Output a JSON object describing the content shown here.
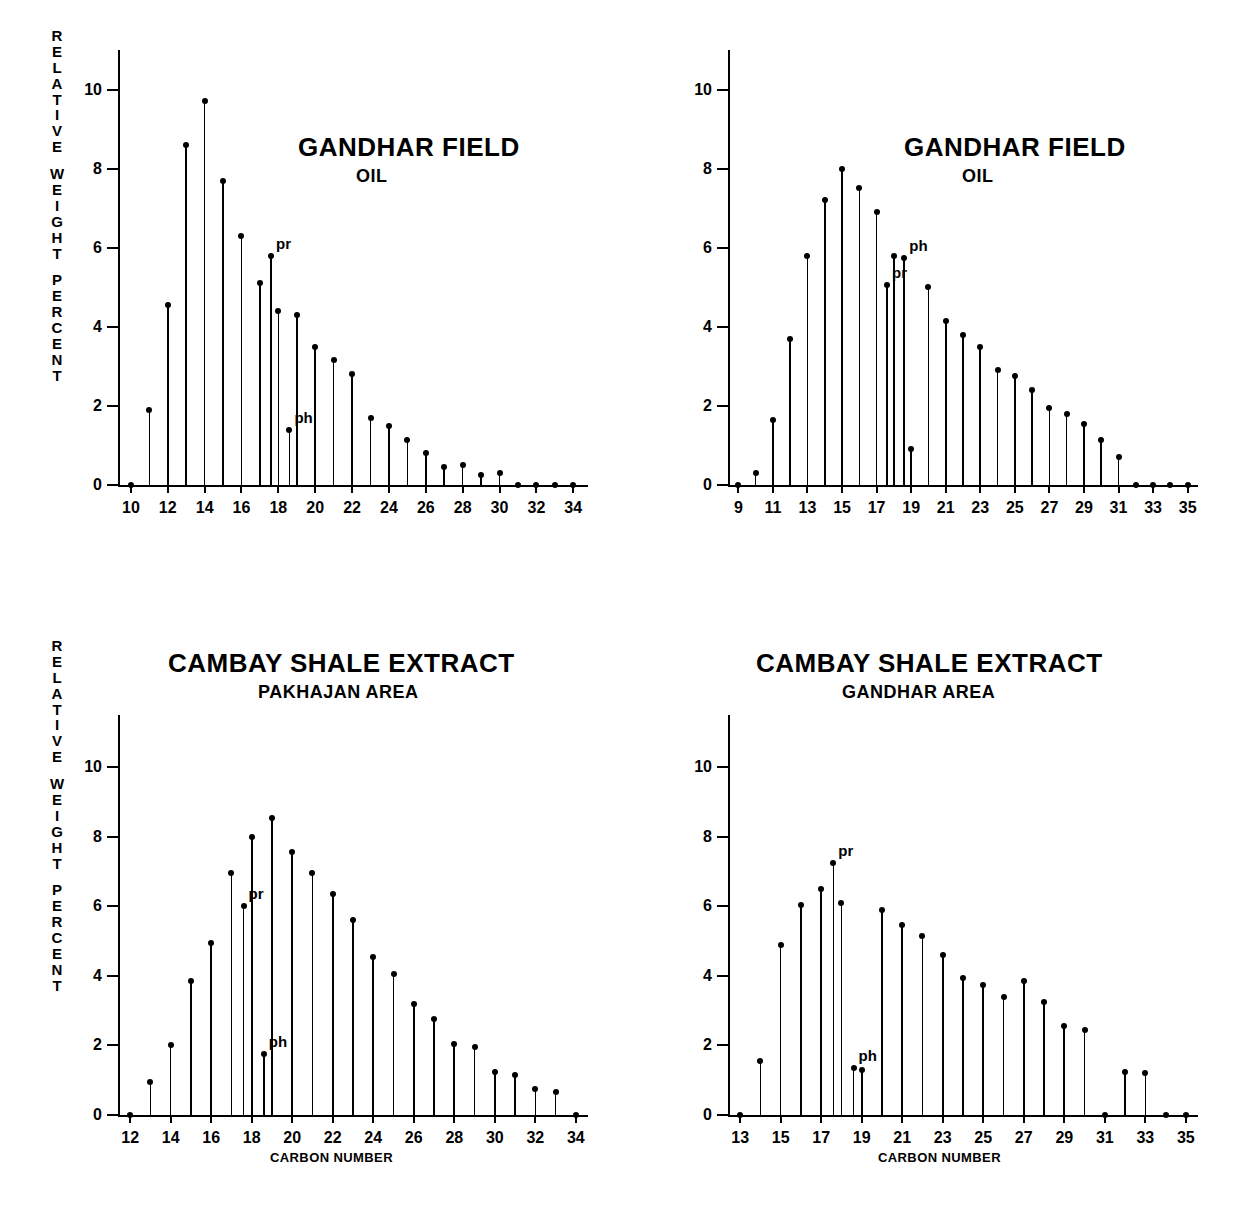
{
  "figure": {
    "y_axis_caption": "RELATIVE WEIGHT PERCENT",
    "y_axis_caption_groups": [
      [
        "R",
        "E",
        "L",
        "A",
        "T",
        "I",
        "V",
        "E"
      ],
      [
        "W",
        "E",
        "I",
        "G",
        "H",
        "T"
      ],
      [
        "P",
        "E",
        "R",
        "C",
        "E",
        "N",
        "T"
      ]
    ],
    "x_axis_caption": "CARBON NUMBER",
    "annotation_pristane": "pr",
    "annotation_phytane": "ph",
    "ink_color": "#000000",
    "background_color": "#ffffff"
  },
  "chart_data": [
    {
      "id": "panel-top-left",
      "type": "bar",
      "title": "GANDHAR FIELD",
      "subtitle": "OIL",
      "xlabel": "",
      "ylabel": "RELATIVE WEIGHT PERCENT",
      "ylim": [
        0,
        11
      ],
      "yticks": [
        0,
        2,
        4,
        6,
        8,
        10
      ],
      "xlim": [
        9.3,
        34.8
      ],
      "xticks": [
        10,
        12,
        14,
        16,
        18,
        20,
        22,
        24,
        26,
        28,
        30,
        32,
        34
      ],
      "grid": false,
      "legend": "none",
      "categories": [
        10,
        11,
        12,
        13,
        14,
        15,
        16,
        17,
        18,
        19,
        20,
        21,
        22,
        23,
        24,
        25,
        26,
        27,
        28,
        29,
        30,
        31,
        32,
        33,
        34
      ],
      "values": [
        0.05,
        1.9,
        4.55,
        8.6,
        9.7,
        7.7,
        6.3,
        5.1,
        4.4,
        4.3,
        3.5,
        3.15,
        2.8,
        1.7,
        1.5,
        1.15,
        0.8,
        0.45,
        0.5,
        0.25,
        0.3,
        0.05,
        0.0,
        0.0,
        0.0
      ],
      "annotations": [
        {
          "label": "pr",
          "carbon": 17.6,
          "value": 5.8
        },
        {
          "label": "ph",
          "carbon": 18.6,
          "value": 1.4
        }
      ],
      "extra_stems": [
        {
          "carbon": 17.6,
          "value": 5.8,
          "label": "pristane"
        },
        {
          "carbon": 18.6,
          "value": 1.4,
          "label": "phytane"
        }
      ]
    },
    {
      "id": "panel-top-right",
      "type": "bar",
      "title": "GANDHAR FIELD",
      "subtitle": "OIL",
      "xlabel": "",
      "ylabel": "",
      "ylim": [
        0,
        11
      ],
      "yticks": [
        0,
        2,
        4,
        6,
        8,
        10
      ],
      "xlim": [
        8.4,
        35.6
      ],
      "xticks": [
        9,
        11,
        13,
        15,
        17,
        19,
        21,
        23,
        25,
        27,
        29,
        31,
        33,
        35
      ],
      "grid": false,
      "legend": "none",
      "categories": [
        9,
        10,
        11,
        12,
        13,
        14,
        15,
        16,
        17,
        18,
        19,
        20,
        21,
        22,
        23,
        24,
        25,
        26,
        27,
        28,
        29,
        30,
        31,
        32,
        33,
        34,
        35
      ],
      "values": [
        0.1,
        0.3,
        1.65,
        3.7,
        5.8,
        7.2,
        8.0,
        7.5,
        6.9,
        5.8,
        0.9,
        5.0,
        4.15,
        3.8,
        3.5,
        2.9,
        2.75,
        2.4,
        1.95,
        1.8,
        1.55,
        1.15,
        0.7,
        0.05,
        0.0,
        0.0,
        0.0
      ],
      "annotations": [
        {
          "label": "pr",
          "carbon": 17.6,
          "value": 5.05
        },
        {
          "label": "ph",
          "carbon": 18.6,
          "value": 5.75
        }
      ],
      "extra_stems": [
        {
          "carbon": 17.6,
          "value": 5.05,
          "label": "pristane"
        },
        {
          "carbon": 18.6,
          "value": 5.75,
          "label": "phytane-coelute"
        }
      ]
    },
    {
      "id": "panel-bottom-left",
      "type": "bar",
      "title": "CAMBAY SHALE EXTRACT",
      "subtitle": "PAKHAJAN AREA",
      "xlabel": "CARBON NUMBER",
      "ylabel": "RELATIVE WEIGHT PERCENT",
      "ylim": [
        0,
        11.5
      ],
      "yticks": [
        0,
        2,
        4,
        6,
        8,
        10
      ],
      "xlim": [
        11.4,
        34.6
      ],
      "xticks": [
        12,
        14,
        16,
        18,
        20,
        22,
        24,
        26,
        28,
        30,
        32,
        34
      ],
      "grid": false,
      "legend": "none",
      "categories": [
        12,
        13,
        14,
        15,
        16,
        17,
        18,
        19,
        20,
        21,
        22,
        23,
        24,
        25,
        26,
        27,
        28,
        29,
        30,
        31,
        32,
        33,
        34
      ],
      "values": [
        0.1,
        0.95,
        2.0,
        3.85,
        4.95,
        6.95,
        8.0,
        8.55,
        7.55,
        6.95,
        6.35,
        5.6,
        4.55,
        4.05,
        3.2,
        2.75,
        2.05,
        1.95,
        1.25,
        1.15,
        0.75,
        0.65,
        0.0
      ],
      "annotations": [
        {
          "label": "pr",
          "carbon": 17.6,
          "value": 6.0
        },
        {
          "label": "ph",
          "carbon": 18.6,
          "value": 1.75
        }
      ],
      "extra_stems": [
        {
          "carbon": 17.6,
          "value": 6.0,
          "label": "pristane"
        },
        {
          "carbon": 18.6,
          "value": 1.75,
          "label": "phytane"
        }
      ]
    },
    {
      "id": "panel-bottom-right",
      "type": "bar",
      "title": "CAMBAY SHALE EXTRACT",
      "subtitle": "GANDHAR AREA",
      "xlabel": "CARBON NUMBER",
      "ylabel": "",
      "ylim": [
        0,
        11.5
      ],
      "yticks": [
        0,
        2,
        4,
        6,
        8,
        10
      ],
      "xlim": [
        12.4,
        35.6
      ],
      "xticks": [
        13,
        15,
        17,
        19,
        21,
        23,
        25,
        27,
        29,
        31,
        33,
        35
      ],
      "grid": false,
      "legend": "none",
      "categories": [
        13,
        14,
        15,
        16,
        17,
        18,
        19,
        20,
        21,
        22,
        23,
        24,
        25,
        26,
        27,
        28,
        29,
        30,
        31,
        32,
        33,
        34,
        35
      ],
      "values": [
        0.05,
        1.55,
        4.9,
        6.05,
        6.5,
        6.1,
        1.3,
        5.9,
        5.45,
        5.15,
        4.6,
        3.95,
        3.75,
        3.4,
        3.85,
        3.25,
        2.55,
        2.45,
        0.05,
        1.25,
        1.2,
        0.0,
        0.0
      ],
      "annotations": [
        {
          "label": "pr",
          "carbon": 17.6,
          "value": 7.25
        },
        {
          "label": "ph",
          "carbon": 18.6,
          "value": 1.35
        }
      ],
      "extra_stems": [
        {
          "carbon": 17.6,
          "value": 7.25,
          "label": "pristane"
        },
        {
          "carbon": 18.6,
          "value": 1.35,
          "label": "phytane"
        }
      ]
    }
  ]
}
